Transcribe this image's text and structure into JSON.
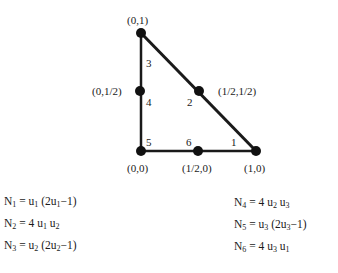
{
  "diagram": {
    "type": "quadratic-triangle-element",
    "nodes": [
      {
        "id": "0,1",
        "label": "(0,1)",
        "number": "3"
      },
      {
        "id": "0,1/2",
        "label": "(0,1/2)",
        "number": "4"
      },
      {
        "id": "0,0",
        "label": "(0,0)",
        "number": "5"
      },
      {
        "id": "1/2,0",
        "label": "(1/2,0)",
        "number": "6"
      },
      {
        "id": "1,0",
        "label": "(1,0)",
        "number": "1"
      },
      {
        "id": "1/2,1/2",
        "label": "(1/2,1/2)",
        "number": "2"
      }
    ],
    "edges": [
      [
        "0,1",
        "1,0"
      ],
      [
        "0,1",
        "0,0"
      ],
      [
        "0,0",
        "1,0"
      ]
    ],
    "colors": {
      "line": "#1a1a1a",
      "node": "#111111"
    }
  },
  "equations": {
    "left": [
      {
        "lhs": "N",
        "lhs_sub": "1",
        "rhs_parts": [
          [
            "u",
            "1"
          ],
          [
            " (2u",
            "1"
          ],
          [
            "−1)",
            ""
          ]
        ]
      },
      {
        "lhs": "N",
        "lhs_sub": "2",
        "rhs_parts": [
          [
            "4 u",
            "1"
          ],
          [
            " u",
            "2"
          ]
        ]
      },
      {
        "lhs": "N",
        "lhs_sub": "3",
        "rhs_parts": [
          [
            "u",
            "2"
          ],
          [
            " (2u",
            "2"
          ],
          [
            "−1)",
            ""
          ]
        ]
      }
    ],
    "right": [
      {
        "lhs": "N",
        "lhs_sub": "4",
        "rhs_parts": [
          [
            "4 u",
            "2"
          ],
          [
            " u",
            "3"
          ]
        ]
      },
      {
        "lhs": "N",
        "lhs_sub": "5",
        "rhs_parts": [
          [
            "u",
            "3"
          ],
          [
            " (2u",
            "3"
          ],
          [
            "−1)",
            ""
          ]
        ]
      },
      {
        "lhs": "N",
        "lhs_sub": "6",
        "rhs_parts": [
          [
            "4 u",
            "3"
          ],
          [
            " u",
            "1"
          ]
        ]
      }
    ]
  }
}
